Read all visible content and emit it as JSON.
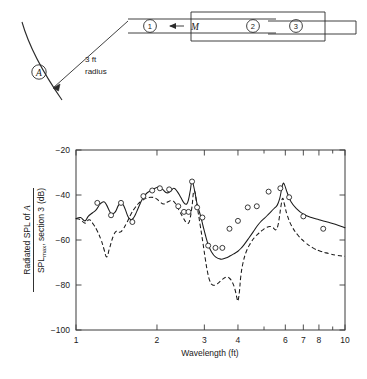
{
  "figure": {
    "diagram": {
      "name": "duct-sections-schematic",
      "observer_label": "A",
      "radius_label_line1": "3 ft",
      "radius_label_line2": "radius",
      "flow_label": "M",
      "section_labels": [
        "1",
        "2",
        "3"
      ]
    }
  },
  "chart_data": {
    "type": "line",
    "title": "",
    "xlabel": "Wavelength (ft)",
    "ylabel": "Radiated SPL of A / SPL_max, section 3 (dB)",
    "ylabel_parts": {
      "numerator_prefix": "Radiated SPL of ",
      "numerator_italic": "A",
      "denominator_prefix": "SPL",
      "denominator_sub": "max",
      "denominator_suffix": ", section 3",
      "units": "(dB)"
    },
    "xscale": "log",
    "xlim": [
      1,
      10
    ],
    "ylim": [
      -100,
      -20
    ],
    "grid": false,
    "legend": null,
    "xticks": [
      1,
      2,
      3,
      4,
      5,
      6,
      7,
      8,
      9,
      10
    ],
    "xticklabels": [
      "1",
      "2",
      "3",
      "4",
      "",
      "6",
      "7",
      "8",
      "",
      "10"
    ],
    "yticks": [
      -100,
      -80,
      -60,
      -40,
      -20
    ],
    "yticklabels": [
      "-100",
      "-80",
      "-60",
      "-40",
      "-20"
    ],
    "series": [
      {
        "name": "theory-solid",
        "style": "solid",
        "x": [
          1.0,
          1.04,
          1.08,
          1.11,
          1.15,
          1.19,
          1.23,
          1.27,
          1.3,
          1.33,
          1.36,
          1.4,
          1.44,
          1.48,
          1.52,
          1.56,
          1.6,
          1.64,
          1.68,
          1.73,
          1.78,
          1.84,
          1.9,
          1.97,
          2.03,
          2.1,
          2.17,
          2.24,
          2.31,
          2.38,
          2.45,
          2.52,
          2.58,
          2.62,
          2.66,
          2.7,
          2.76,
          2.82,
          2.9,
          2.97,
          3.03,
          3.1,
          3.18,
          3.3,
          3.45,
          3.6,
          3.75,
          3.88,
          4.0,
          4.12,
          4.25,
          4.4,
          4.55,
          4.7,
          4.85,
          5.0,
          5.15,
          5.3,
          5.45,
          5.6,
          5.72,
          5.8,
          5.88,
          5.96,
          6.1,
          6.3,
          6.6,
          7.0,
          7.5,
          8.0,
          8.6,
          9.2,
          10.0
        ],
        "y": [
          -50.5,
          -50.0,
          -51.5,
          -49.5,
          -48.0,
          -46.5,
          -44.0,
          -43.0,
          -44.5,
          -47.0,
          -48.5,
          -47.5,
          -44.5,
          -43.5,
          -46.0,
          -49.5,
          -51.0,
          -50.0,
          -47.5,
          -44.0,
          -41.0,
          -39.0,
          -38.0,
          -37.0,
          -36.5,
          -37.5,
          -39.0,
          -38.5,
          -37.0,
          -38.5,
          -41.0,
          -43.5,
          -44.0,
          -42.0,
          -38.0,
          -34.0,
          -38.0,
          -44.0,
          -49.0,
          -54.0,
          -58.0,
          -62.0,
          -65.0,
          -67.5,
          -68.5,
          -68.0,
          -67.0,
          -66.0,
          -65.0,
          -63.5,
          -61.5,
          -59.0,
          -56.5,
          -54.0,
          -52.0,
          -50.5,
          -49.0,
          -47.5,
          -46.0,
          -44.5,
          -41.5,
          -38.0,
          -35.0,
          -35.5,
          -39.0,
          -43.0,
          -46.0,
          -48.5,
          -50.0,
          -51.0,
          -52.0,
          -53.0,
          -54.5
        ]
      },
      {
        "name": "theory-dashed",
        "style": "dashed",
        "x": [
          1.0,
          1.04,
          1.08,
          1.12,
          1.16,
          1.2,
          1.24,
          1.27,
          1.3,
          1.33,
          1.36,
          1.38,
          1.4,
          1.43,
          1.46,
          1.5,
          1.55,
          1.6,
          1.65,
          1.7,
          1.76,
          1.82,
          1.9,
          1.98,
          2.05,
          2.12,
          2.2,
          2.28,
          2.35,
          2.42,
          2.5,
          2.56,
          2.62,
          2.66,
          2.7,
          2.75,
          2.82,
          2.9,
          2.97,
          3.03,
          3.08,
          3.14,
          3.22,
          3.35,
          3.5,
          3.62,
          3.72,
          3.82,
          3.9,
          3.96,
          4.0,
          4.05,
          4.1,
          4.18,
          4.3,
          4.45,
          4.6,
          4.78,
          4.95,
          5.1,
          5.25,
          5.4,
          5.52,
          5.62,
          5.7,
          5.78,
          5.86,
          5.95,
          6.1,
          6.35,
          6.7,
          7.1,
          7.6,
          8.1,
          8.7,
          9.3,
          10.0
        ],
        "y": [
          -50.5,
          -51.0,
          -52.5,
          -51.0,
          -53.0,
          -56.0,
          -60.0,
          -64.0,
          -67.5,
          -64.0,
          -60.0,
          -58.0,
          -56.5,
          -56.0,
          -56.5,
          -55.0,
          -52.0,
          -48.5,
          -46.0,
          -44.0,
          -42.5,
          -41.5,
          -41.0,
          -41.5,
          -43.0,
          -44.0,
          -43.0,
          -42.5,
          -44.0,
          -47.0,
          -50.0,
          -52.0,
          -52.5,
          -50.0,
          -45.0,
          -38.0,
          -45.0,
          -54.0,
          -62.0,
          -69.0,
          -74.0,
          -78.0,
          -80.0,
          -79.5,
          -77.5,
          -76.5,
          -77.0,
          -79.0,
          -82.0,
          -85.5,
          -87.0,
          -83.0,
          -76.0,
          -70.0,
          -65.0,
          -61.5,
          -59.0,
          -57.0,
          -55.5,
          -54.5,
          -54.0,
          -54.5,
          -55.5,
          -54.0,
          -50.0,
          -45.0,
          -41.5,
          -44.0,
          -49.0,
          -54.0,
          -58.0,
          -61.0,
          -63.5,
          -65.0,
          -66.0,
          -66.8,
          -67.2
        ]
      }
    ],
    "measured_points": {
      "name": "measured",
      "marker": "open-circle",
      "x": [
        1.2,
        1.35,
        1.47,
        1.62,
        1.78,
        1.92,
        2.05,
        2.22,
        2.4,
        2.52,
        2.62,
        2.7,
        2.82,
        2.95,
        3.1,
        3.3,
        3.5,
        3.72,
        4.0,
        4.35,
        4.7,
        5.2,
        5.75,
        6.2,
        7.0,
        8.3
      ],
      "y": [
        -43.5,
        -49.0,
        -43.5,
        -52.0,
        -40.5,
        -38.0,
        -37.0,
        -37.5,
        -45.0,
        -47.5,
        -47.5,
        -34.0,
        -45.5,
        -50.0,
        -62.5,
        -63.5,
        -63.5,
        -55.0,
        -51.5,
        -45.5,
        -45.0,
        -38.5,
        -37.0,
        -41.0,
        -49.5,
        -55.0
      ]
    }
  }
}
